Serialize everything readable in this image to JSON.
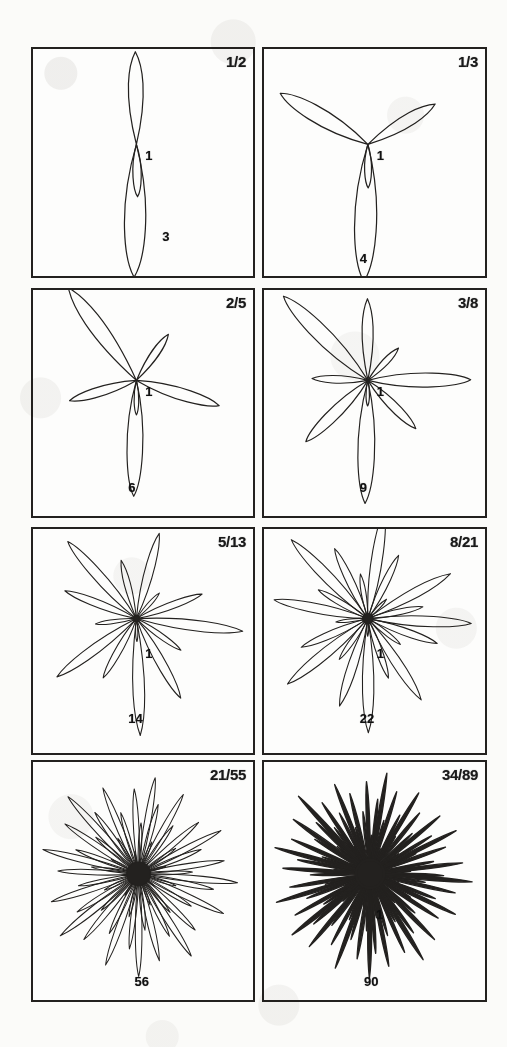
{
  "figure": {
    "ink_color": "#23211f",
    "paper_color": "#fbfbf9",
    "columns": 2,
    "rows": 4
  },
  "panels": [
    {
      "id": "panel-1-2",
      "fraction_label": "1/2",
      "numerator": 1,
      "denominator": 2,
      "divergence_deg": 180,
      "leaf_count": 3,
      "leaf_labels": [
        {
          "text": "1",
          "leaf_index": 1
        },
        {
          "text": "3",
          "leaf_index": 3
        }
      ],
      "x": 31,
      "y": 47,
      "w": 224,
      "h": 231
    },
    {
      "id": "panel-1-3",
      "fraction_label": "1/3",
      "numerator": 1,
      "denominator": 3,
      "divergence_deg": 120,
      "leaf_count": 4,
      "leaf_labels": [
        {
          "text": "1",
          "leaf_index": 1
        },
        {
          "text": "4",
          "leaf_index": 4
        }
      ],
      "x": 262,
      "y": 47,
      "w": 225,
      "h": 231
    },
    {
      "id": "panel-2-5",
      "fraction_label": "2/5",
      "numerator": 2,
      "denominator": 5,
      "divergence_deg": 144,
      "leaf_count": 6,
      "leaf_labels": [
        {
          "text": "1",
          "leaf_index": 1
        },
        {
          "text": "6",
          "leaf_index": 6
        }
      ],
      "x": 31,
      "y": 288,
      "w": 224,
      "h": 230
    },
    {
      "id": "panel-3-8",
      "fraction_label": "3/8",
      "numerator": 3,
      "denominator": 8,
      "divergence_deg": 135,
      "leaf_count": 9,
      "leaf_labels": [
        {
          "text": "1",
          "leaf_index": 1
        },
        {
          "text": "9",
          "leaf_index": 9
        }
      ],
      "x": 262,
      "y": 288,
      "w": 225,
      "h": 230
    },
    {
      "id": "panel-5-13",
      "fraction_label": "5/13",
      "numerator": 5,
      "denominator": 13,
      "divergence_deg": 138.46,
      "leaf_count": 14,
      "leaf_labels": [
        {
          "text": "1",
          "leaf_index": 1
        },
        {
          "text": "14",
          "leaf_index": 14
        }
      ],
      "x": 31,
      "y": 527,
      "w": 224,
      "h": 228
    },
    {
      "id": "panel-8-21",
      "fraction_label": "8/21",
      "numerator": 8,
      "denominator": 21,
      "divergence_deg": 137.14,
      "leaf_count": 22,
      "leaf_labels": [
        {
          "text": "1",
          "leaf_index": 1
        },
        {
          "text": "22",
          "leaf_index": 22
        }
      ],
      "x": 262,
      "y": 527,
      "w": 225,
      "h": 228
    },
    {
      "id": "panel-21-55",
      "fraction_label": "21/55",
      "numerator": 21,
      "denominator": 55,
      "divergence_deg": 137.45,
      "leaf_count": 56,
      "leaf_labels": [
        {
          "text": "56",
          "leaf_index": 56
        }
      ],
      "x": 31,
      "y": 760,
      "w": 224,
      "h": 242
    },
    {
      "id": "panel-34-89",
      "fraction_label": "34/89",
      "numerator": 34,
      "denominator": 89,
      "divergence_deg": 137.53,
      "leaf_count": 90,
      "leaf_labels": [
        {
          "text": "1",
          "leaf_index": 1
        },
        {
          "text": "90",
          "leaf_index": 90
        }
      ],
      "x": 262,
      "y": 760,
      "w": 225,
      "h": 242
    }
  ]
}
